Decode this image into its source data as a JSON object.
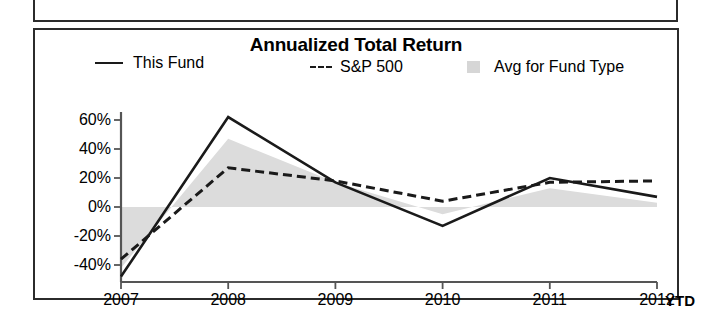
{
  "panel": {
    "title": "Annualized Total Return"
  },
  "legend": {
    "items": [
      {
        "label": "This Fund",
        "marker": "solid-line",
        "name": "legend-this-fund"
      },
      {
        "label": "S&P 500",
        "marker": "dashed-line",
        "name": "legend-sp500",
        "dash_glyph": "---"
      },
      {
        "label": "Avg for Fund Type",
        "marker": "gray-swatch",
        "name": "legend-avg"
      }
    ]
  },
  "axes": {
    "y_ticks": [
      "60%",
      "40%",
      "20%",
      "0%",
      "-20%",
      "-40%"
    ],
    "x_ticks": [
      "2007",
      "2008",
      "2009",
      "2010",
      "2011",
      "2012"
    ],
    "x_suffix": "YTD"
  },
  "colors": {
    "line_primary": "#1a1a1a",
    "line_benchmark": "#1a1a1a",
    "area_fill": "#dcdcdc",
    "area_fill_legend": "#d6d6d6",
    "axis": "#555555",
    "border": "#2b2b2b",
    "background": "#ffffff"
  },
  "chart_data": {
    "type": "line",
    "title": "Annualized Total Return",
    "xlabel": "",
    "ylabel": "",
    "categories": [
      "2007",
      "2008",
      "2009",
      "2010",
      "2011",
      "2012"
    ],
    "x_axis_note": "YTD",
    "ylim": [
      -50,
      70
    ],
    "y_ticks": [
      60,
      40,
      20,
      0,
      -20,
      -40
    ],
    "y_tick_labels": [
      "60%",
      "40%",
      "20%",
      "0%",
      "-20%",
      "-40%"
    ],
    "grid": false,
    "legend_position": "top",
    "units": "percent",
    "series": [
      {
        "name": "This Fund",
        "style": "solid",
        "color": "#1a1a1a",
        "values": [
          -48,
          62,
          17,
          -13,
          20,
          7
        ]
      },
      {
        "name": "S&P 500",
        "style": "dashed",
        "color": "#1a1a1a",
        "values": [
          -36,
          27,
          18,
          4,
          17,
          18
        ]
      },
      {
        "name": "Avg for Fund Type",
        "style": "filled-area",
        "color": "#dcdcdc",
        "values": [
          -42,
          47,
          17,
          -5,
          13,
          3
        ]
      }
    ]
  }
}
